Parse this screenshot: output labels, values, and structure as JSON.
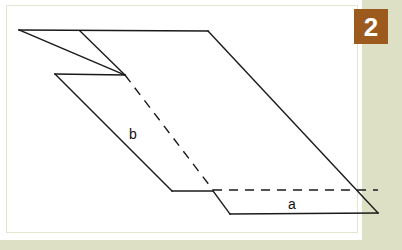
{
  "page": {
    "width": 402,
    "height": 250,
    "background_color": "#dde0c4",
    "card_color": "#ffffff",
    "card_border_color": "#e3e6cf"
  },
  "badge": {
    "label": "2",
    "background_color": "#9c5a1e",
    "text_color": "#ffffff",
    "x": 354,
    "y": 9,
    "width": 34,
    "height": 35,
    "font_size": 26
  },
  "figure": {
    "type": "geometry-diagram",
    "stroke_color": "#1a1a1a",
    "stroke_width": 1.4,
    "dash_pattern": "9,7",
    "labels": [
      {
        "text": "b",
        "x": 133,
        "y": 139,
        "font_size": 14
      },
      {
        "text": "a",
        "x": 292,
        "y": 209,
        "font_size": 14
      }
    ],
    "solid_paths": [
      "M19,30 L208,31",
      "M19,30 L125,75",
      "M80,31 L125,75",
      "M55,74 L125,75",
      "M208,31 L378,213",
      "M230,214 L378,213",
      "M55,74 L172,191",
      "M172,191 L213,191",
      "M213,191 L230,214"
    ],
    "dashed_paths": [
      "M125,75 L213,190",
      "M213,190 L378,190"
    ]
  }
}
